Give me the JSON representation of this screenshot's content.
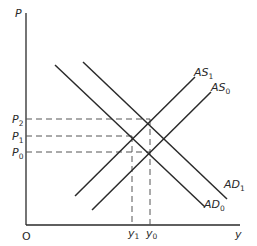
{
  "diagram": {
    "title": "",
    "type": "AD-AS model",
    "axes": {
      "y_label": "P",
      "x_label": "y",
      "origin_label": "O"
    },
    "curves": [
      {
        "id": "AD0",
        "label_main": "AD",
        "label_sub": "0",
        "kind": "demand"
      },
      {
        "id": "AD1",
        "label_main": "AD",
        "label_sub": "1",
        "kind": "demand"
      },
      {
        "id": "AS0",
        "label_main": "AS",
        "label_sub": "0",
        "kind": "supply"
      },
      {
        "id": "AS1",
        "label_main": "AS",
        "label_sub": "1",
        "kind": "supply"
      }
    ],
    "price_levels": [
      {
        "label_main": "P",
        "label_sub": "2"
      },
      {
        "label_main": "P",
        "label_sub": "1"
      },
      {
        "label_main": "P",
        "label_sub": "0"
      }
    ],
    "output_levels": [
      {
        "label_main": "y",
        "label_sub": "1"
      },
      {
        "label_main": "y",
        "label_sub": "0"
      }
    ],
    "equilibria": [
      {
        "curves": "AD1 x AS1",
        "price": "P2",
        "output": "y0"
      },
      {
        "curves": "AD0 x AS1",
        "price": "P1",
        "output": "y1"
      },
      {
        "curves": "AD0 x AS0",
        "price": "P0",
        "output": "y0"
      }
    ],
    "colors": {
      "line": "#2a2a2a",
      "dash": "#555555",
      "background": "#ffffff"
    }
  }
}
